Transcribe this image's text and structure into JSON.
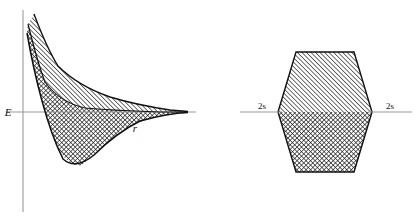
{
  "figure": {
    "type": "diagram",
    "background_color": "#ffffff",
    "ink_color": "#111111",
    "axis_color": "#9a9a9a"
  },
  "left_panel": {
    "name": "energy-vs-distance-plot",
    "axes": {
      "vertical_label": "E",
      "horizontal_label": "r",
      "vertical_axis": {
        "x": 23,
        "y_top": 10,
        "y_bottom": 212
      },
      "horizontal_axis": {
        "y": 112,
        "x_left": 6,
        "x_right": 196
      }
    },
    "regions": [
      {
        "name": "antibonding-region",
        "fill": "diagonal-hatch",
        "note": "Upper shaded band between the antibonding curve and the bonding curve, above the energy zero line"
      },
      {
        "name": "bonding-region",
        "fill": "cross-hatch",
        "note": "Lower shaded band bounded by the bonding energy curve, dipping below the energy zero line into a potential well"
      }
    ],
    "curves": [
      {
        "name": "antibonding-curve",
        "role": "upper repulsive curve",
        "points": [
          [
            34,
            14
          ],
          [
            40,
            30
          ],
          [
            48,
            50
          ],
          [
            58,
            66
          ],
          [
            72,
            80
          ],
          [
            90,
            90
          ],
          [
            110,
            97
          ],
          [
            130,
            103
          ],
          [
            150,
            107
          ],
          [
            170,
            110
          ],
          [
            186,
            111
          ]
        ]
      },
      {
        "name": "bonding-curve",
        "role": "lower attractive curve with potential minimum",
        "points": [
          [
            27,
            33
          ],
          [
            31,
            55
          ],
          [
            36,
            78
          ],
          [
            42,
            100
          ],
          [
            48,
            122
          ],
          [
            55,
            142
          ],
          [
            63,
            158
          ],
          [
            72,
            166
          ],
          [
            82,
            164
          ],
          [
            94,
            154
          ],
          [
            108,
            140
          ],
          [
            124,
            128
          ],
          [
            140,
            120
          ],
          [
            158,
            115
          ],
          [
            174,
            112
          ],
          [
            188,
            111
          ]
        ]
      },
      {
        "name": "inner-separatrix-curve",
        "role": "boundary between hatched and cross-hatched regions",
        "points": [
          [
            28,
            24
          ],
          [
            33,
            44
          ],
          [
            38,
            64
          ],
          [
            45,
            82
          ],
          [
            55,
            96
          ],
          [
            68,
            104
          ],
          [
            85,
            108
          ],
          [
            105,
            110
          ],
          [
            130,
            111
          ],
          [
            160,
            112
          ],
          [
            186,
            112
          ]
        ]
      }
    ]
  },
  "right_panel": {
    "name": "energy-band-hexagon",
    "labels": {
      "left_orbital": "2s",
      "right_orbital": "2s"
    },
    "reference_lines": [
      {
        "name": "left-level-line",
        "y": 112,
        "x_left": 240,
        "x_right": 282
      },
      {
        "name": "right-level-line",
        "y": 112,
        "x_left": 368,
        "x_right": 412
      }
    ],
    "hexagon": {
      "vertices": [
        [
          278,
          112
        ],
        [
          296,
          52
        ],
        [
          354,
          52
        ],
        [
          372,
          112
        ],
        [
          354,
          172
        ],
        [
          296,
          172
        ]
      ],
      "upper_half_fill": "diagonal-hatch",
      "lower_half_fill": "cross-hatch",
      "midline_y": 112
    }
  }
}
